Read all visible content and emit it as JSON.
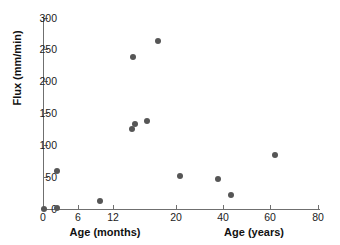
{
  "chart_data": {
    "type": "scatter",
    "title": "",
    "xlabel": "Age (months) / Age (years)",
    "ylabel": "Flux (mm/min)",
    "xlabel_left": "Age (months)",
    "xlabel_right": "Age (years)",
    "grid": false,
    "legend": "none",
    "ylim": [
      0,
      300
    ],
    "y_ticks": [
      0,
      50,
      100,
      150,
      200,
      250,
      300
    ],
    "x_ticks": [
      0,
      6,
      12,
      20,
      40,
      60,
      80
    ],
    "x_axis_note": "Piecewise axis: 0-12 labelled in months, 20-80 labelled in years",
    "points": [
      {
        "x": 0.2,
        "y": 2,
        "px": 44,
        "py": 209
      },
      {
        "x": 1.3,
        "y": 3,
        "px": 57,
        "py": 208
      },
      {
        "x": 1.3,
        "y": 62,
        "px": 57,
        "py": 171
      },
      {
        "x": 8.8,
        "y": 16,
        "px": 100,
        "py": 201
      },
      {
        "x": 13.0,
        "y": 121,
        "px": 132,
        "py": 129
      },
      {
        "x": 13.3,
        "y": 130,
        "px": 135,
        "py": 124
      },
      {
        "x": 13.0,
        "y": 237,
        "px": 133,
        "py": 57
      },
      {
        "x": 15.3,
        "y": 136,
        "px": 147,
        "py": 121
      },
      {
        "x": 17.8,
        "y": 262,
        "px": 158,
        "py": 41
      },
      {
        "x": 21.0,
        "y": 56,
        "px": 180,
        "py": 176
      },
      {
        "x": 37.5,
        "y": 51,
        "px": 218,
        "py": 179
      },
      {
        "x": 42.0,
        "y": 24,
        "px": 231,
        "py": 195
      },
      {
        "x": 59.5,
        "y": 86,
        "px": 275,
        "py": 155
      }
    ],
    "marker_color": "#565656",
    "axis_color": "#6f6f6f"
  },
  "axes": {
    "y_title": "Flux (mm/min)",
    "x_title_left": "Age (months)",
    "x_title_right": "Age (years)",
    "y_tick_labels": [
      "0",
      "50",
      "100",
      "150",
      "200",
      "250",
      "300"
    ],
    "y_tick_py": [
      209,
      177,
      145,
      113,
      81,
      49,
      18
    ],
    "x_tick_labels": [
      "0",
      "6",
      "12",
      "20",
      "40",
      "60",
      "80"
    ],
    "x_tick_px": [
      43,
      78,
      113,
      176,
      223,
      270,
      318
    ]
  }
}
